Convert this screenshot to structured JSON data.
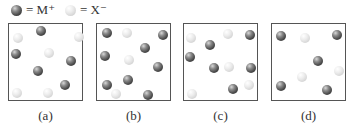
{
  "legend": [
    {
      "kind": "dark",
      "label": "= M⁺",
      "icon": "dark-sphere-icon"
    },
    {
      "kind": "light",
      "label": "= X⁻",
      "icon": "light-sphere-icon"
    }
  ],
  "panels": [
    {
      "label": "(a)",
      "left": 8,
      "balls": [
        {
          "k": "light",
          "x": 9,
          "y": 14
        },
        {
          "k": "dark",
          "x": 32,
          "y": 7
        },
        {
          "k": "light",
          "x": 70,
          "y": 13
        },
        {
          "k": "dark",
          "x": 7,
          "y": 30
        },
        {
          "k": "light",
          "x": 40,
          "y": 29
        },
        {
          "k": "dark",
          "x": 62,
          "y": 37
        },
        {
          "k": "dark",
          "x": 29,
          "y": 47
        },
        {
          "k": "dark",
          "x": 56,
          "y": 61
        },
        {
          "k": "light",
          "x": 8,
          "y": 69
        },
        {
          "k": "light",
          "x": 39,
          "y": 69
        }
      ]
    },
    {
      "label": "(b)",
      "left": 96,
      "balls": [
        {
          "k": "dark",
          "x": 10,
          "y": 9
        },
        {
          "k": "light",
          "x": 30,
          "y": 9
        },
        {
          "k": "dark",
          "x": 66,
          "y": 11
        },
        {
          "k": "dark",
          "x": 48,
          "y": 24
        },
        {
          "k": "dark",
          "x": 8,
          "y": 32
        },
        {
          "k": "light",
          "x": 32,
          "y": 36
        },
        {
          "k": "dark",
          "x": 61,
          "y": 43
        },
        {
          "k": "dark",
          "x": 31,
          "y": 56
        },
        {
          "k": "dark",
          "x": 10,
          "y": 61
        },
        {
          "k": "light",
          "x": 19,
          "y": 70
        },
        {
          "k": "dark",
          "x": 51,
          "y": 71
        }
      ]
    },
    {
      "label": "(c)",
      "left": 183,
      "balls": [
        {
          "k": "light",
          "x": 7,
          "y": 14
        },
        {
          "k": "light",
          "x": 44,
          "y": 10
        },
        {
          "k": "dark",
          "x": 66,
          "y": 11
        },
        {
          "k": "dark",
          "x": 26,
          "y": 21
        },
        {
          "k": "dark",
          "x": 6,
          "y": 33
        },
        {
          "k": "dark",
          "x": 30,
          "y": 44
        },
        {
          "k": "light",
          "x": 45,
          "y": 43
        },
        {
          "k": "dark",
          "x": 67,
          "y": 44
        },
        {
          "k": "dark",
          "x": 49,
          "y": 65
        },
        {
          "k": "light",
          "x": 65,
          "y": 61
        },
        {
          "k": "light",
          "x": 8,
          "y": 70
        }
      ]
    },
    {
      "label": "(d)",
      "left": 271,
      "balls": [
        {
          "k": "dark",
          "x": 9,
          "y": 12
        },
        {
          "k": "light",
          "x": 33,
          "y": 14
        },
        {
          "k": "dark",
          "x": 65,
          "y": 11
        },
        {
          "k": "dark",
          "x": 46,
          "y": 37
        },
        {
          "k": "light",
          "x": 67,
          "y": 47
        },
        {
          "k": "light",
          "x": 30,
          "y": 53
        },
        {
          "k": "dark",
          "x": 9,
          "y": 62
        },
        {
          "k": "dark",
          "x": 55,
          "y": 66
        }
      ]
    }
  ]
}
